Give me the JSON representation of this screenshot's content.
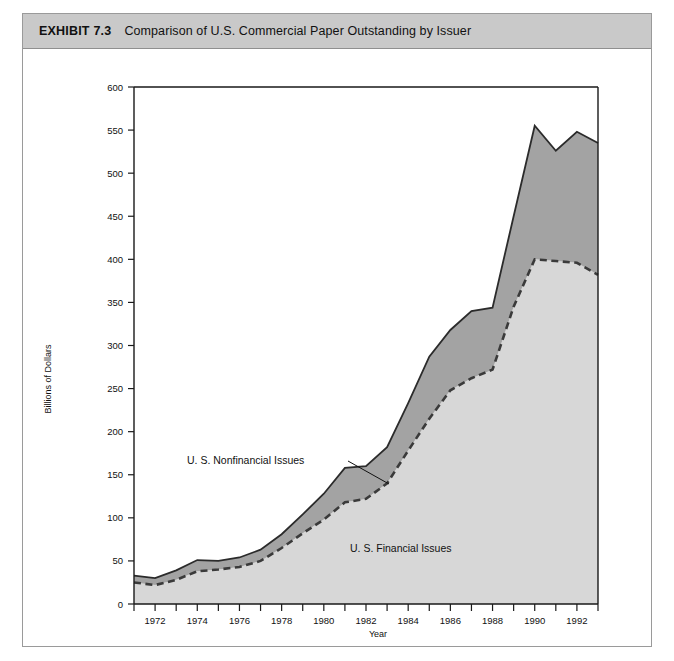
{
  "exhibit": {
    "label": "EXHIBIT 7.3",
    "title": "Comparison of U.S. Commercial Paper Outstanding by Issuer"
  },
  "annotations": {
    "nonfinancial": "U. S. Nonfinancial Issues",
    "financial": "U. S. Financial Issues"
  },
  "colors": {
    "header_band": "#c9c9c9",
    "financial_area": "#d7d7d7",
    "nonfinancial_area": "#a3a3a3",
    "total_line": "#2b2b2b",
    "financial_line": "#3a3a3a",
    "frame": "#9a9a9a"
  },
  "chart_data": {
    "type": "area",
    "title": "Comparison of U.S. Commercial Paper Outstanding by Issuer",
    "xlabel": "Year",
    "ylabel": "Billions of Dollars",
    "xlim": [
      1971,
      1993
    ],
    "ylim": [
      0,
      600
    ],
    "ytick_step": 50,
    "grid": false,
    "legend": "inline-annotations",
    "stacked": true,
    "x": [
      1971,
      1972,
      1973,
      1974,
      1975,
      1976,
      1977,
      1978,
      1979,
      1980,
      1981,
      1982,
      1983,
      1984,
      1985,
      1986,
      1987,
      1988,
      1989,
      1990,
      1991,
      1992,
      1993
    ],
    "xticks": [
      1971,
      1972,
      1973,
      1974,
      1975,
      1976,
      1977,
      1978,
      1979,
      1980,
      1981,
      1982,
      1983,
      1984,
      1985,
      1986,
      1987,
      1988,
      1989,
      1990,
      1991,
      1992,
      1993
    ],
    "xtick_labels": [
      "",
      "1972",
      "",
      "1974",
      "",
      "1976",
      "",
      "1978",
      "",
      "1980",
      "",
      "1982",
      "",
      "1984",
      "",
      "1986",
      "",
      "1988",
      "",
      "1990",
      "",
      "1992",
      ""
    ],
    "yticks": [
      0,
      50,
      100,
      150,
      200,
      250,
      300,
      350,
      400,
      450,
      500,
      550,
      600
    ],
    "ytick_labels": [
      "0",
      "50",
      "100",
      "150",
      "200",
      "250",
      "300",
      "350",
      "400",
      "450",
      "500",
      "550",
      "600"
    ],
    "series": [
      {
        "name": "U. S. Financial Issues",
        "style": "dashed-line-lower-boundary",
        "values": [
          25,
          22,
          28,
          38,
          40,
          43,
          50,
          65,
          82,
          98,
          118,
          122,
          140,
          178,
          215,
          248,
          262,
          272,
          345,
          400,
          398,
          396,
          382
        ]
      },
      {
        "name": "U. S. Nonfinancial Issues",
        "style": "upper-band",
        "values": [
          8,
          8,
          11,
          13,
          10,
          11,
          13,
          16,
          22,
          30,
          40,
          38,
          42,
          55,
          72,
          70,
          78,
          72,
          105,
          155,
          128,
          152,
          153
        ]
      }
    ],
    "totals": [
      33,
      30,
      39,
      51,
      50,
      54,
      63,
      81,
      104,
      128,
      158,
      160,
      182,
      233,
      287,
      318,
      340,
      344,
      450,
      555,
      526,
      548,
      535
    ],
    "peak": {
      "year": 1990,
      "total": 555
    }
  }
}
